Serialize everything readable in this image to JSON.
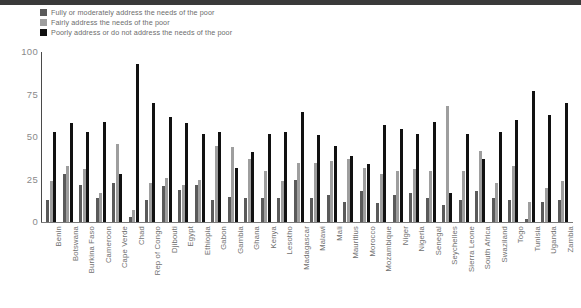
{
  "legend": {
    "position": "top-left",
    "items": [
      {
        "label": "Fully or moderately address the needs of the poor",
        "color": "#5a5a5a",
        "icon": "legend-swatch"
      },
      {
        "label": "Fairly address the needs of the poor",
        "color": "#9e9e9e",
        "icon": "legend-swatch"
      },
      {
        "label": "Poorly address or do not address the needs of the poor",
        "color": "#111111",
        "icon": "legend-swatch"
      }
    ]
  },
  "axis": {
    "y_ticks": [
      "0",
      "25",
      "50",
      "75",
      "100"
    ]
  },
  "chart_data": {
    "type": "bar",
    "title": "",
    "subtitle": "",
    "xlabel": "",
    "ylabel": "",
    "ylim": [
      0,
      100
    ],
    "yticks": [
      0,
      25,
      50,
      75,
      100
    ],
    "grid": false,
    "legend_position": "top-left",
    "categories": [
      "Benin",
      "Botswana",
      "Burkina Faso",
      "Cameroon",
      "Cape Verde",
      "Chad",
      "Rep of Congo",
      "Djibouti",
      "Egypt",
      "Ethiopia",
      "Gabon",
      "Gambia",
      "Ghana",
      "Kenya",
      "Lesotho",
      "Madagascar",
      "Malawi",
      "Mali",
      "Mauritius",
      "Morocco",
      "Mozambique",
      "Niger",
      "Nigeria",
      "Senegal",
      "Seychelles",
      "Sierra Leone",
      "South Africa",
      "Swaziland",
      "Togo",
      "Tunisia",
      "Uganda",
      "Zambia"
    ],
    "series": [
      {
        "name": "Fully or moderately address the needs of the poor",
        "color": "#5a5a5a",
        "values": [
          13,
          28,
          22,
          14,
          23,
          3,
          13,
          21,
          19,
          22,
          13,
          15,
          14,
          14,
          14,
          25,
          14,
          16,
          12,
          18,
          11,
          16,
          17,
          14,
          10,
          13,
          18,
          14,
          13,
          2,
          12,
          13
        ]
      },
      {
        "name": "Fairly address the needs of the poor",
        "color": "#9e9e9e",
        "values": [
          24,
          33,
          31,
          17,
          46,
          7,
          23,
          26,
          22,
          25,
          45,
          44,
          37,
          30,
          24,
          35,
          35,
          36,
          37,
          32,
          28,
          30,
          31,
          30,
          68,
          30,
          42,
          23,
          33,
          12,
          20,
          24
        ]
      },
      {
        "name": "Poorly address or do not address the needs of the poor",
        "color": "#111111",
        "values": [
          53,
          58,
          53,
          59,
          28,
          93,
          70,
          62,
          58,
          52,
          53,
          32,
          41,
          52,
          53,
          65,
          51,
          45,
          39,
          34,
          57,
          55,
          52,
          59,
          17,
          52,
          37,
          53,
          60,
          77,
          63,
          70
        ]
      }
    ]
  }
}
